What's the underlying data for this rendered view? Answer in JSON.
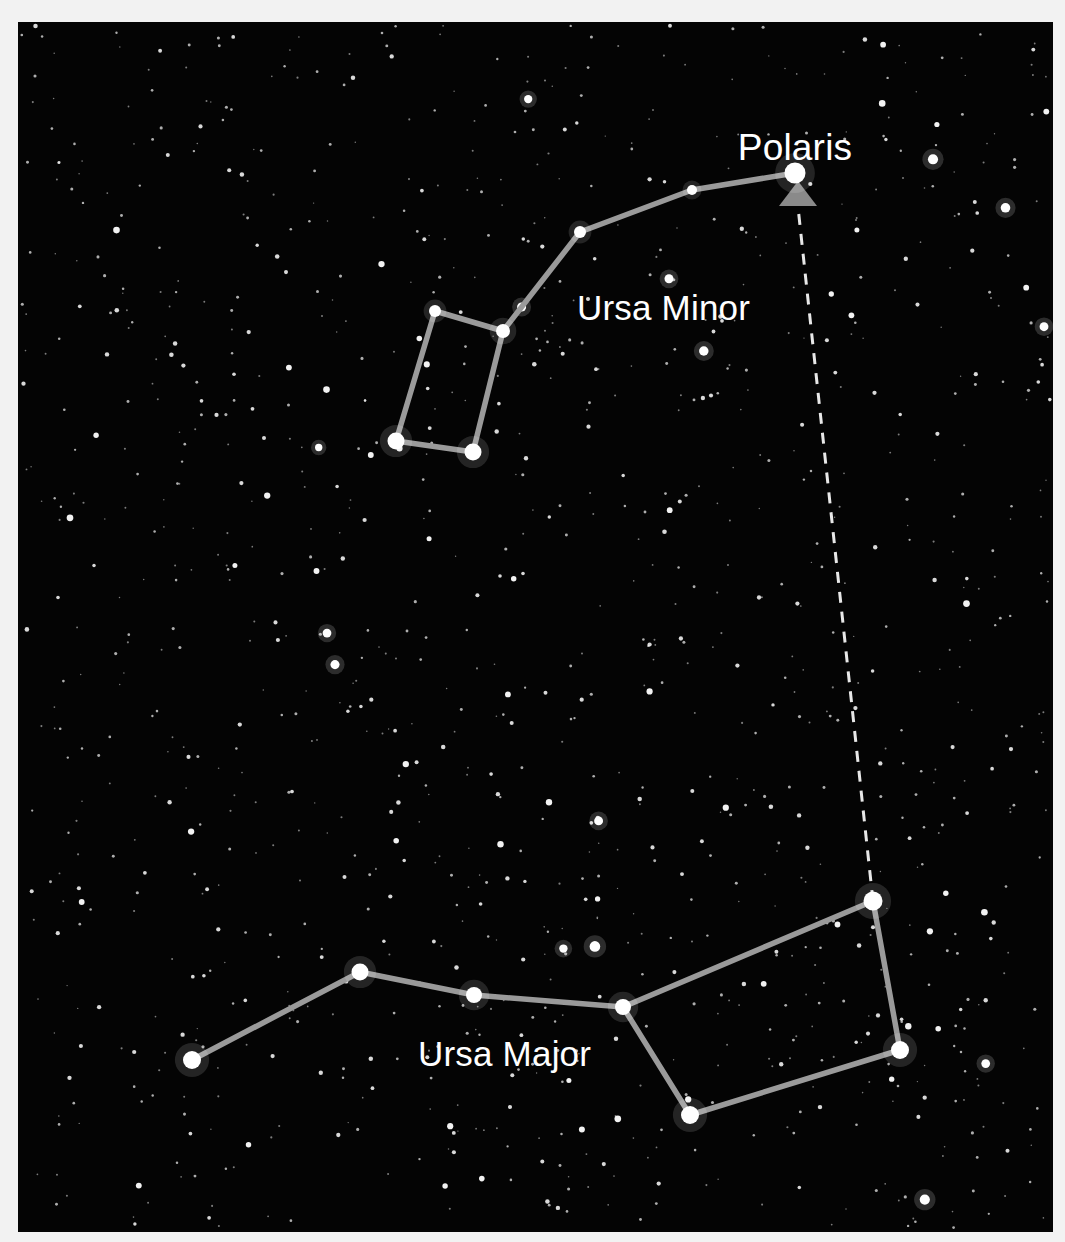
{
  "figure": {
    "kind": "star-chart",
    "width": 1065,
    "height": 1242,
    "background_color": "#f2f2f2",
    "sky_color": "#040404",
    "sky_rect": {
      "x": 18,
      "y": 22,
      "width": 1035,
      "height": 1210
    }
  },
  "labels": {
    "polaris": "Polaris",
    "ursa_minor": "Ursa Minor",
    "ursa_major": "Ursa Major"
  },
  "label_positions": {
    "polaris": {
      "x": 795,
      "y": 160,
      "anchor": "middle"
    },
    "ursa_minor": {
      "x": 577,
      "y": 320,
      "anchor": "start"
    },
    "ursa_major": {
      "x": 418,
      "y": 1066,
      "anchor": "start"
    }
  },
  "colors": {
    "star_fill": "#ffffff",
    "line_stroke": "#9a9a9a",
    "pointer_stroke": "#e8e8e8",
    "arrow_fill": "#8a8a8a",
    "label_text": "#ffffff"
  },
  "chart_data": {
    "type": "scatter",
    "constellations": [
      {
        "name": "Ursa Minor",
        "label": "Ursa Minor",
        "stars": [
          {
            "name": "Polaris",
            "x": 795,
            "y": 173,
            "r": 10.5,
            "magnitude_rank": 1
          },
          {
            "name": "um-handle-2",
            "x": 692,
            "y": 190,
            "r": 5.0,
            "magnitude_rank": 4
          },
          {
            "name": "um-handle-3",
            "x": 580,
            "y": 232,
            "r": 6.0,
            "magnitude_rank": 3
          },
          {
            "name": "um-bowl-ne",
            "x": 503,
            "y": 331,
            "r": 7.0,
            "magnitude_rank": 2
          },
          {
            "name": "um-bowl-nw",
            "x": 435,
            "y": 311,
            "r": 6.0,
            "magnitude_rank": 3
          },
          {
            "name": "um-bowl-sw",
            "x": 396,
            "y": 441,
            "r": 8.5,
            "magnitude_rank": 2
          },
          {
            "name": "um-bowl-se",
            "x": 473,
            "y": 452,
            "r": 8.5,
            "magnitude_rank": 2
          }
        ],
        "lines": [
          [
            795,
            173,
            692,
            190
          ],
          [
            692,
            190,
            580,
            232
          ],
          [
            580,
            232,
            503,
            331
          ],
          [
            503,
            331,
            435,
            311
          ],
          [
            435,
            311,
            396,
            441
          ],
          [
            396,
            441,
            473,
            452
          ],
          [
            473,
            452,
            503,
            331
          ]
        ]
      },
      {
        "name": "Ursa Major",
        "label": "Ursa Major",
        "stars": [
          {
            "name": "UMa-handle-tip",
            "x": 192,
            "y": 1060,
            "r": 9.0,
            "magnitude_rank": 2
          },
          {
            "name": "UMa-handle-mid",
            "x": 360,
            "y": 972,
            "r": 8.5,
            "magnitude_rank": 2
          },
          {
            "name": "UMa-handle-base",
            "x": 474,
            "y": 995,
            "r": 8.0,
            "magnitude_rank": 2
          },
          {
            "name": "UMa-bowl-nw",
            "x": 623,
            "y": 1007,
            "r": 8.0,
            "magnitude_rank": 2
          },
          {
            "name": "UMa-bowl-ne",
            "x": 873,
            "y": 901,
            "r": 9.5,
            "magnitude_rank": 1
          },
          {
            "name": "UMa-bowl-se",
            "x": 900,
            "y": 1050,
            "r": 9.0,
            "magnitude_rank": 2
          },
          {
            "name": "UMa-bowl-sw",
            "x": 690,
            "y": 1115,
            "r": 9.0,
            "magnitude_rank": 2
          }
        ],
        "lines": [
          [
            192,
            1060,
            360,
            972
          ],
          [
            360,
            972,
            474,
            995
          ],
          [
            474,
            995,
            623,
            1007
          ],
          [
            623,
            1007,
            873,
            901
          ],
          [
            873,
            901,
            900,
            1050
          ],
          [
            900,
            1050,
            690,
            1115
          ],
          [
            690,
            1115,
            623,
            1007
          ]
        ]
      }
    ],
    "pointer": {
      "description": "Pointer line from Ursa Major bowl star to Polaris",
      "from": {
        "x": 873,
        "y": 901
      },
      "to": {
        "x": 798,
        "y": 207
      },
      "dashed": true,
      "arrow": {
        "apex_x": 798,
        "apex_y": 181,
        "half_width": 19,
        "base_y": 206
      }
    }
  }
}
